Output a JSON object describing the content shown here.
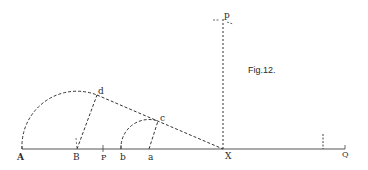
{
  "figure": {
    "caption": "Fig.12.",
    "colors": {
      "ink": "#333333",
      "background": "#ffffff"
    },
    "baseline": {
      "y": 149,
      "x_start": 22,
      "x_end": 345
    },
    "points": {
      "A": {
        "label": "A",
        "x": 22,
        "y": 149
      },
      "B": {
        "label": "B",
        "x": 77,
        "y": 149
      },
      "P": {
        "label": "P",
        "x": 103,
        "y": 149
      },
      "b": {
        "label": "b",
        "x": 121,
        "y": 149
      },
      "a": {
        "label": "a",
        "x": 149,
        "y": 149
      },
      "X": {
        "label": "X",
        "x": 223,
        "y": 149
      },
      "Q": {
        "label": "Q",
        "x": 345,
        "y": 149
      },
      "d": {
        "label": "d",
        "x": 97,
        "y": 95
      },
      "c": {
        "label": "c",
        "x": 158,
        "y": 121
      },
      "p": {
        "label": "p",
        "x": 223,
        "y": 20
      }
    },
    "labels": {
      "A": "A",
      "B": "B",
      "P": "P",
      "b": "b",
      "a": "a",
      "X": "X",
      "Q": "Q",
      "d": "d",
      "c": "c",
      "p": "p"
    }
  }
}
